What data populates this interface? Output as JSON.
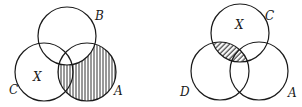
{
  "diagrams": [
    {
      "name": "venn-left",
      "circles": [
        {
          "label": "B",
          "cx": 67,
          "cy": 36,
          "r": 29
        },
        {
          "label": "C",
          "cx": 44,
          "cy": 72,
          "r": 29
        },
        {
          "label": "A",
          "cx": 87,
          "cy": 72,
          "r": 29
        }
      ],
      "labels": {
        "B": "B",
        "X": "X",
        "C": "C",
        "A": "A"
      },
      "shaded_region": "A minus B",
      "hatch": "vertical"
    },
    {
      "name": "venn-right",
      "circles": [
        {
          "label": "C",
          "cx": 240,
          "cy": 33,
          "r": 29
        },
        {
          "label": "D",
          "cx": 220,
          "cy": 71,
          "r": 29
        },
        {
          "label": "A",
          "cx": 259,
          "cy": 71,
          "r": 29
        }
      ],
      "labels": {
        "C": "C",
        "X": "X",
        "D": "D",
        "A": "A"
      },
      "shaded_region": "C intersect D",
      "hatch": "diagonal"
    }
  ],
  "colors": {
    "stroke": "#1a1a1a",
    "background": "#ffffff"
  }
}
